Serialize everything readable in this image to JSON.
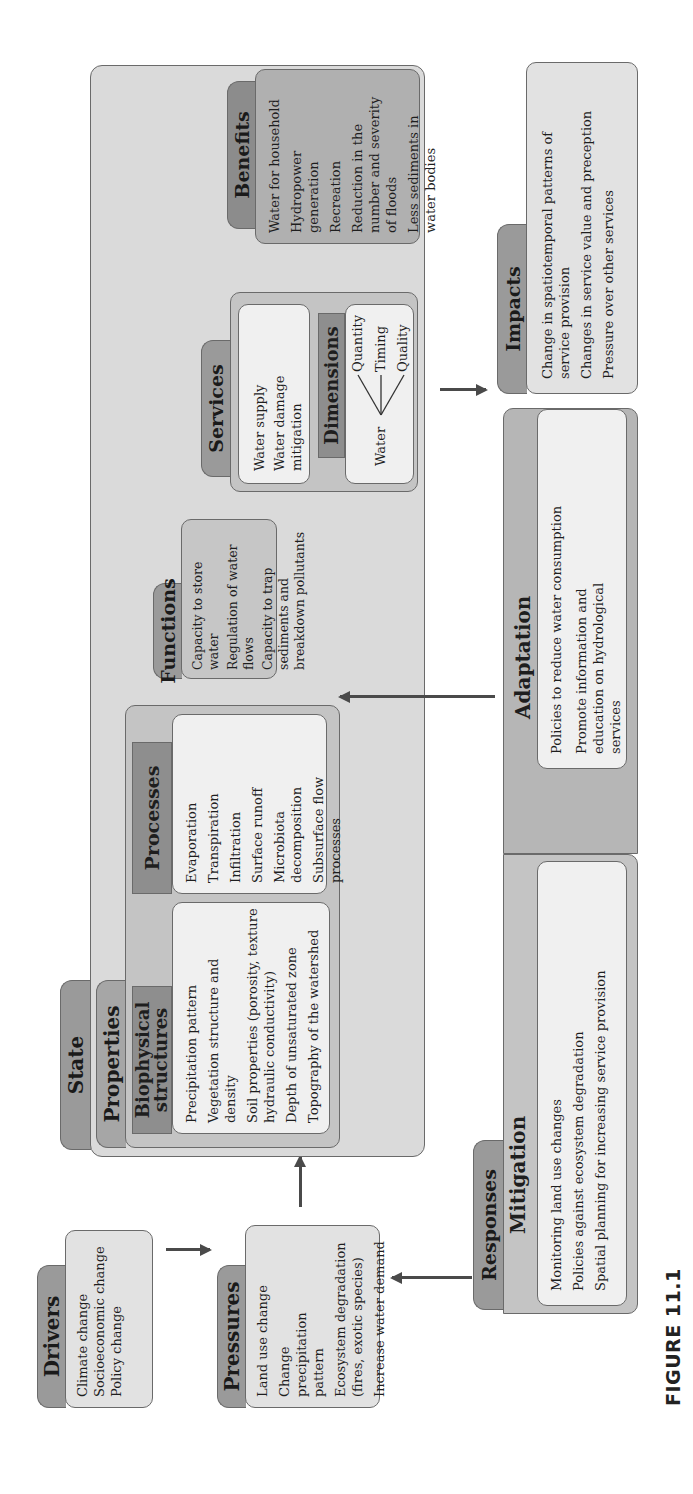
{
  "figure": {
    "caption": "FIGURE 11.1"
  },
  "drivers": {
    "title": "Drivers",
    "items": [
      "Climate change",
      "Socioeconomic change",
      "Policy change"
    ]
  },
  "pressures": {
    "title": "Pressures",
    "items": [
      "Land use change",
      "Change precipitation pattern",
      "Ecosystem degradation (fires, exotic species)",
      "Increase water demand"
    ]
  },
  "state": {
    "title": "State",
    "properties": {
      "title": "Properties",
      "biophysical": {
        "title_line1": "Biophysical",
        "title_line2": "structures",
        "items": [
          "Precipitation pattern",
          "Vegetation structure and density",
          "Soil properties (porosity, texture hydraulic conductivity)",
          "Depth of unsaturated zone",
          "Topography of the watershed"
        ]
      },
      "processes": {
        "title": "Processes",
        "items": [
          "Evaporation",
          "Transpiration",
          "Infiltration",
          "Surface runoff",
          "Microbiota decomposition",
          "Subsurface flow processes"
        ]
      }
    },
    "functions": {
      "title": "Functions",
      "items": [
        "Capacity to store water",
        "Regulation of water flows",
        "Capacity to trap sediments and breakdown pollutants"
      ]
    },
    "services": {
      "title": "Services",
      "items": [
        "Water supply",
        "Water damage mitigation"
      ],
      "dimensions": {
        "title": "Dimensions",
        "root": "Water",
        "branches": [
          "Quantity",
          "Timing",
          "Quality"
        ]
      }
    },
    "benefits": {
      "title": "Benefits",
      "items": [
        "Water for household",
        "Hydropower generation",
        "Recreation",
        "Reduction in the number and severity of floods",
        "Less sediments in water bodies"
      ]
    }
  },
  "impacts": {
    "title": "Impacts",
    "items": [
      "Change in spatiotemporal patterns of service provision",
      "Changes in service value and preception",
      "Pressure over other services"
    ]
  },
  "responses": {
    "title": "Responses",
    "mitigation": {
      "title": "Mitigation",
      "items": [
        "Monitoring land use changes",
        "Policies against ecosystem degradation",
        "Spatial planning for increasing service provision"
      ]
    },
    "adaptation": {
      "title": "Adaptation",
      "items": [
        "Policies to reduce water consumption",
        "Promote information and education on hydrological services"
      ]
    }
  },
  "colors": {
    "tab_fill": "#9a9a9a",
    "panel_fill": "#dadada",
    "light_box": "#f0f0f0",
    "border": "#6a6a6a",
    "arrow": "#4a4a4a"
  }
}
